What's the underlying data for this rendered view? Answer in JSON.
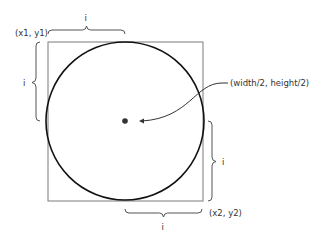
{
  "diagram": {
    "type": "ellipse-corners-mode",
    "colors": {
      "square_stroke": "#7a7a7a",
      "circle_stroke": "#111111",
      "brace_stroke": "#555555",
      "arrow_stroke": "#333333",
      "text": "#333333",
      "center_dot": "#333333"
    },
    "labels": {
      "top_left_corner": "(x1, y1)",
      "bottom_right_corner": "(x2, y2)",
      "center": "(width/2, height/2)",
      "top_brace": "i",
      "left_brace": "i",
      "right_brace": "i",
      "bottom_brace": "i"
    }
  }
}
